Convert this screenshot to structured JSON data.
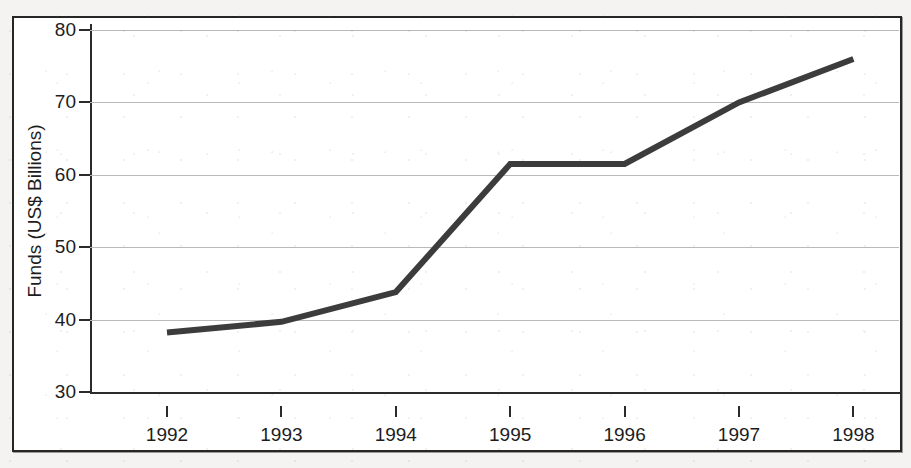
{
  "figure": {
    "frame_border_color": "#262626",
    "background_color": "#ffffff",
    "page_background_color": "#f4f3f1"
  },
  "chart_data": {
    "type": "line",
    "title": "",
    "xlabel": "",
    "ylabel": "Funds (US$ Billions)",
    "categories": [
      "1992",
      "1993",
      "1994",
      "1995",
      "1996",
      "1997",
      "1998"
    ],
    "x": [
      1992,
      1993,
      1994,
      1995,
      1996,
      1997,
      1998
    ],
    "values": [
      38.2,
      39.7,
      43.8,
      61.5,
      61.5,
      70.0,
      76.0
    ],
    "series": [
      {
        "name": "Funds",
        "values": [
          38.2,
          39.7,
          43.8,
          61.5,
          61.5,
          70.0,
          76.0
        ],
        "color": "#3c3c3c",
        "line_width": 6,
        "markers": false
      }
    ],
    "ylim": [
      30,
      80
    ],
    "yticks": [
      30,
      40,
      50,
      60,
      70,
      80
    ],
    "ytick_labels": [
      "30",
      "40",
      "50",
      "60",
      "70",
      "80"
    ],
    "xtick_labels": [
      "1992",
      "1993",
      "1994",
      "1995",
      "1996",
      "1997",
      "1998"
    ],
    "grid": true,
    "grid_axis": "y",
    "grid_color": "#b9b9b9",
    "legend": false,
    "legend_position": "none",
    "axis_color": "#2b2b2b",
    "annotations": []
  }
}
